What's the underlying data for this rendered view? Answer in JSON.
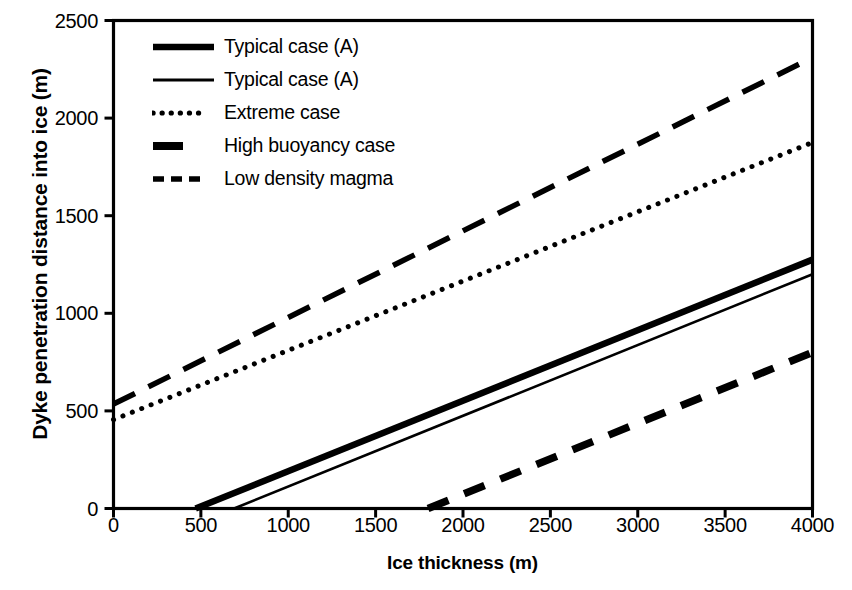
{
  "chart_data": {
    "type": "line",
    "title": "",
    "xlabel": "Ice thickness (m)",
    "ylabel": "Dyke penetration distance into ice (m)",
    "xlim": [
      0,
      4000
    ],
    "ylim": [
      0,
      2500
    ],
    "xticks": [
      0,
      500,
      1000,
      1500,
      2000,
      2500,
      3000,
      3500,
      4000
    ],
    "yticks": [
      0,
      500,
      1000,
      1500,
      2000,
      2500
    ],
    "xtick_labels": [
      "0",
      "500",
      "1000",
      "1500",
      "2000",
      "2500",
      "3000",
      "3500",
      "4000"
    ],
    "ytick_labels": [
      "0",
      "500",
      "1000",
      "1500",
      "2000",
      "2500"
    ],
    "grid": false,
    "legend_position": "upper-left",
    "frame": "box",
    "series": [
      {
        "name": "Typical case (A)",
        "style": "solid-thick",
        "color": "#000000",
        "x": [
          470,
          4000
        ],
        "y": [
          0,
          1275
        ]
      },
      {
        "name": "Typical case (A)",
        "style": "solid-thin",
        "color": "#000000",
        "x": [
          690,
          4000
        ],
        "y": [
          0,
          1200
        ]
      },
      {
        "name": "Extreme case",
        "style": "dotted",
        "color": "#000000",
        "x": [
          0,
          4000
        ],
        "y": [
          455,
          1875
        ]
      },
      {
        "name": "High buoyancy case",
        "style": "dashed-thick",
        "color": "#000000",
        "x": [
          1800,
          4000
        ],
        "y": [
          0,
          800
        ]
      },
      {
        "name": "Low density magma",
        "style": "dashed",
        "color": "#000000",
        "x": [
          0,
          4000
        ],
        "y": [
          535,
          2310
        ]
      }
    ]
  },
  "legend": {
    "items": [
      {
        "label": "Typical case (A)",
        "key": "solid-thick-swatch"
      },
      {
        "label": "Typical case (A)",
        "key": "solid-thin-swatch"
      },
      {
        "label": "Extreme case",
        "key": "dotted-swatch"
      },
      {
        "label": "High buoyancy case",
        "key": "dashed-thick-swatch"
      },
      {
        "label": "Low density magma",
        "key": "dashed-swatch"
      }
    ]
  },
  "axes": {
    "x_title": "Ice thickness (m)",
    "y_title": "Dyke penetration distance into ice (m)"
  }
}
